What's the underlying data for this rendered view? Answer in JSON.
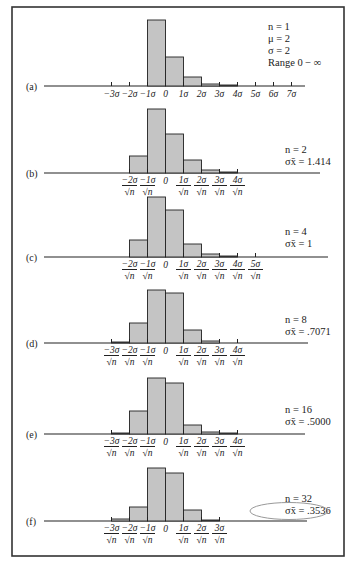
{
  "chart_data": [
    {
      "type": "bar",
      "panel": "(a)",
      "title": "Sampling distribution, n = 1",
      "annotations": [
        "n = 1",
        "μ = 2",
        "σ = 2",
        "Range 0 − ∞"
      ],
      "tick_labels": [
        "−3σ",
        "−2σ",
        "−1σ",
        "0",
        "1σ",
        "2σ",
        "3σ",
        "4σ",
        "5σ",
        "6σ",
        "7σ"
      ],
      "tick_positions": [
        -3,
        -2,
        -1,
        0,
        1,
        2,
        3,
        4,
        5,
        6,
        7
      ],
      "sqrt_n_denominator": false,
      "bins": [
        [
          -1,
          0
        ],
        [
          0,
          1
        ],
        [
          1,
          2
        ],
        [
          2,
          3
        ],
        [
          3,
          4
        ]
      ],
      "values": [
        66,
        29,
        9,
        2,
        0.5
      ],
      "ylim": [
        0,
        70
      ],
      "grid": false
    },
    {
      "type": "bar",
      "panel": "(b)",
      "annotations": [
        "n = 2",
        "σx̄ = 1.414"
      ],
      "tick_labels": [
        "−2σ",
        "−1σ",
        "0",
        "1σ",
        "2σ",
        "3σ",
        "4σ"
      ],
      "tick_positions": [
        -2,
        -1,
        0,
        1,
        2,
        3,
        4
      ],
      "sqrt_n_denominator": true,
      "bins": [
        [
          -2,
          -1
        ],
        [
          -1,
          0
        ],
        [
          0,
          1
        ],
        [
          1,
          2
        ],
        [
          2,
          3
        ],
        [
          3,
          4
        ]
      ],
      "values": [
        17,
        64,
        39,
        13,
        3,
        1
      ],
      "ylim": [
        0,
        70
      ],
      "grid": false
    },
    {
      "type": "bar",
      "panel": "(c)",
      "annotations": [
        "n = 4",
        "σx̄ = 1"
      ],
      "tick_labels": [
        "−2σ",
        "−1σ",
        "0",
        "1σ",
        "2σ",
        "3σ",
        "4σ",
        "5σ"
      ],
      "tick_positions": [
        -2,
        -1,
        0,
        1,
        2,
        3,
        4,
        5
      ],
      "sqrt_n_denominator": true,
      "bins": [
        [
          -2,
          -1
        ],
        [
          -1,
          0
        ],
        [
          0,
          1
        ],
        [
          1,
          2
        ],
        [
          2,
          3
        ],
        [
          3,
          4
        ]
      ],
      "values": [
        17,
        60,
        47,
        13,
        3,
        1
      ],
      "ylim": [
        0,
        70
      ],
      "grid": false
    },
    {
      "type": "bar",
      "panel": "(d)",
      "annotations": [
        "n = 8",
        "σx̄ = .7071"
      ],
      "tick_labels": [
        "−3σ",
        "−2σ",
        "−1σ",
        "0",
        "1σ",
        "2σ",
        "3σ",
        "4σ"
      ],
      "tick_positions": [
        -3,
        -2,
        -1,
        0,
        1,
        2,
        3,
        4
      ],
      "sqrt_n_denominator": true,
      "bins": [
        [
          -3,
          -2
        ],
        [
          -2,
          -1
        ],
        [
          -1,
          0
        ],
        [
          0,
          1
        ],
        [
          1,
          2
        ],
        [
          2,
          3
        ]
      ],
      "values": [
        1,
        20,
        53,
        50,
        13,
        2
      ],
      "ylim": [
        0,
        70
      ],
      "grid": false
    },
    {
      "type": "bar",
      "panel": "(e)",
      "annotations": [
        "n = 16",
        "σx̄ = .5000"
      ],
      "tick_labels": [
        "−3σ",
        "−2σ",
        "−1σ",
        "0",
        "1σ",
        "2σ",
        "3σ",
        "4σ"
      ],
      "tick_positions": [
        -3,
        -2,
        -1,
        0,
        1,
        2,
        3,
        4
      ],
      "sqrt_n_denominator": true,
      "bins": [
        [
          -3,
          -2
        ],
        [
          -2,
          -1
        ],
        [
          -1,
          0
        ],
        [
          0,
          1
        ],
        [
          1,
          2
        ],
        [
          2,
          3
        ],
        [
          3,
          4
        ]
      ],
      "values": [
        1,
        23,
        56,
        51,
        9,
        2,
        1
      ],
      "ylim": [
        0,
        70
      ],
      "grid": false
    },
    {
      "type": "bar",
      "panel": "(f)",
      "annotations": [
        "n = 32",
        "σx̄ = .3536"
      ],
      "highlighted_annotation": "σx̄ = .3536",
      "tick_labels": [
        "−3σ",
        "−2σ",
        "−1σ",
        "0",
        "1σ",
        "2σ",
        "3σ"
      ],
      "tick_positions": [
        -3,
        -2,
        -1,
        0,
        1,
        2,
        3
      ],
      "sqrt_n_denominator": true,
      "bins": [
        [
          -3,
          -2
        ],
        [
          -2,
          -1
        ],
        [
          -1,
          0
        ],
        [
          0,
          1
        ],
        [
          1,
          2
        ],
        [
          2,
          3
        ]
      ],
      "values": [
        2,
        14,
        53,
        48,
        11,
        1
      ],
      "ylim": [
        0,
        70
      ],
      "grid": false
    }
  ],
  "layout": {
    "panel_axis_y": [
      86,
      173,
      257,
      343,
      434,
      521
    ],
    "panel_info_y": [
      30,
      153,
      235,
      323,
      413,
      502
    ],
    "zero_x": 165.5,
    "sigma_px": 18,
    "px_per_unit": 1.0,
    "axis_x_start": 44,
    "axis_x_end": [
      305,
      320,
      328,
      308,
      305,
      307
    ],
    "sqrt_n_label": "√n",
    "colors": {
      "bar_fill": "#c4c4c4",
      "stroke": "#222222",
      "highlight": "#999999"
    }
  }
}
